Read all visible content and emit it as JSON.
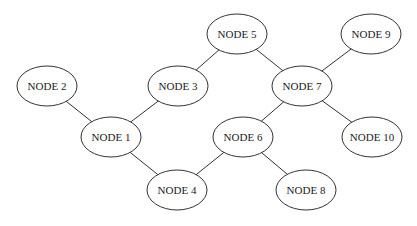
{
  "diagram": {
    "type": "graph",
    "colors": {
      "stroke": "#333333",
      "fill": "#ffffff",
      "text": "#222222",
      "background": "#ffffff"
    },
    "node_rx": 30,
    "node_ry": 20,
    "nodes": [
      {
        "id": "n1",
        "label": "NODE 1",
        "x": 111,
        "y": 137
      },
      {
        "id": "n2",
        "label": "NODE 2",
        "x": 47,
        "y": 86
      },
      {
        "id": "n3",
        "label": "NODE 3",
        "x": 178,
        "y": 86
      },
      {
        "id": "n4",
        "label": "NODE 4",
        "x": 177,
        "y": 190
      },
      {
        "id": "n5",
        "label": "NODE 5",
        "x": 237,
        "y": 34
      },
      {
        "id": "n6",
        "label": "NODE 6",
        "x": 243,
        "y": 137
      },
      {
        "id": "n7",
        "label": "NODE 7",
        "x": 302,
        "y": 86
      },
      {
        "id": "n8",
        "label": "NODE 8",
        "x": 306,
        "y": 190
      },
      {
        "id": "n9",
        "label": "NODE 9",
        "x": 371,
        "y": 34
      },
      {
        "id": "n10",
        "label": "NODE 10",
        "x": 372,
        "y": 137
      }
    ],
    "edges": [
      {
        "from": "n2",
        "to": "n1"
      },
      {
        "from": "n1",
        "to": "n3"
      },
      {
        "from": "n1",
        "to": "n4"
      },
      {
        "from": "n3",
        "to": "n5"
      },
      {
        "from": "n5",
        "to": "n7"
      },
      {
        "from": "n7",
        "to": "n9"
      },
      {
        "from": "n7",
        "to": "n6"
      },
      {
        "from": "n7",
        "to": "n10"
      },
      {
        "from": "n6",
        "to": "n4"
      },
      {
        "from": "n6",
        "to": "n8"
      }
    ]
  }
}
